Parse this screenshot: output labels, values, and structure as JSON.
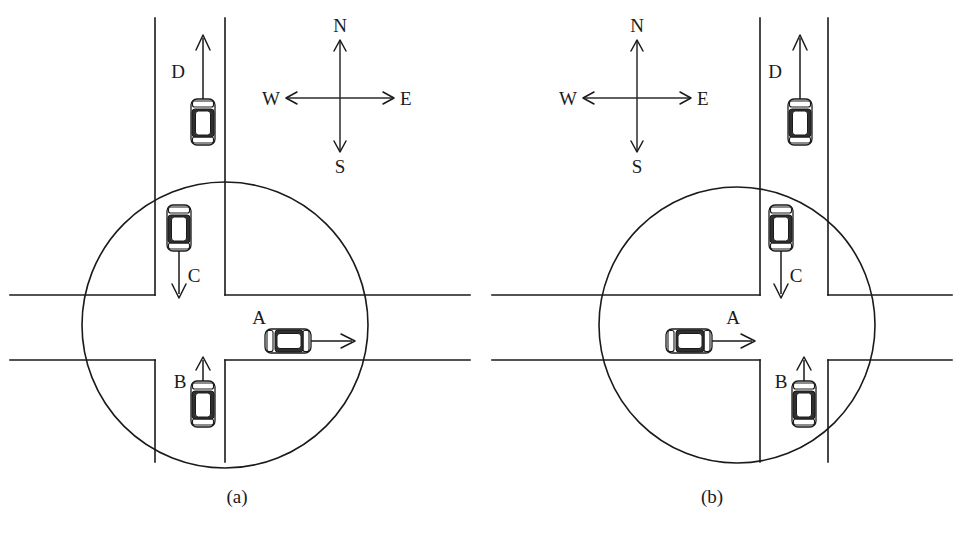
{
  "figure": {
    "background_color": "#ffffff",
    "line_color": "#1a1a1a",
    "roof_color": "#2f2f2f"
  },
  "panels": [
    {
      "id": "a",
      "caption": "(a)",
      "caption_x": 237,
      "caption_y": 503,
      "conflict_zone": {
        "cx": 225,
        "cy": 325,
        "r": 143
      },
      "roads": {
        "vertical_left_x": 155,
        "vertical_right_x": 225,
        "horizontal_top_y": 295,
        "horizontal_bottom_y": 360,
        "center_line_x": 190
      },
      "compass": {
        "cx": 340,
        "cy": 98,
        "north": "N",
        "south": "S",
        "east": "E",
        "west": "W"
      },
      "vehicles": [
        {
          "label": "A",
          "label_x": 258,
          "label_y": 323,
          "orientation": "horizontal",
          "heading": "east",
          "cx": 288,
          "cy": 341,
          "length": 46,
          "width": 23,
          "arrow_from_x": 311,
          "arrow_to_x": 352,
          "arrow_y": 341,
          "inside_zone": true,
          "description": "Car A travelling east through the intersection"
        },
        {
          "label": "B",
          "label_x": 180,
          "label_y": 383,
          "orientation": "vertical",
          "heading": "north",
          "cx": 203,
          "cy": 404,
          "length": 46,
          "width": 23,
          "arrow_from_y": 381,
          "arrow_to_y": 356,
          "arrow_x": 203,
          "inside_zone": true,
          "description": "Car B travelling north, approaching from the south"
        },
        {
          "label": "C",
          "label_x": 192,
          "label_y": 277,
          "orientation": "vertical",
          "heading": "south",
          "cx": 179,
          "cy": 228,
          "length": 46,
          "width": 23,
          "arrow_from_y": 251,
          "arrow_to_y": 297,
          "arrow_x": 179,
          "inside_zone": true,
          "description": "Car C travelling south, inside the conflict zone"
        },
        {
          "label": "D",
          "label_x": 178,
          "label_y": 76,
          "orientation": "vertical",
          "heading": "north",
          "cx": 203,
          "cy": 122,
          "length": 46,
          "width": 23,
          "arrow_from_y": 99,
          "arrow_to_y": 36,
          "arrow_x": 203,
          "inside_zone": false,
          "description": "Car D travelling north, outside the conflict zone"
        }
      ]
    },
    {
      "id": "b",
      "caption": "(b)",
      "caption_x": 712,
      "caption_y": 503,
      "conflict_zone": {
        "cx": 737,
        "cy": 325,
        "r": 138
      },
      "roads": {
        "vertical_left_x": 760,
        "vertical_right_x": 828,
        "horizontal_top_y": 295,
        "horizontal_bottom_y": 360,
        "center_line_x": 794
      },
      "compass": {
        "cx": 637,
        "cy": 98,
        "north": "N",
        "south": "S",
        "east": "E",
        "west": "W"
      },
      "vehicles": [
        {
          "label": "A",
          "label_x": 730,
          "label_y": 323,
          "orientation": "horizontal",
          "heading": "east",
          "cx": 689,
          "cy": 341,
          "length": 46,
          "width": 23,
          "arrow_from_x": 712,
          "arrow_to_x": 752,
          "arrow_y": 341,
          "inside_zone": true,
          "description": "Car A travelling east, west of the intersection centre"
        },
        {
          "label": "B",
          "label_x": 777,
          "label_y": 383,
          "orientation": "vertical",
          "heading": "north",
          "cx": 804,
          "cy": 404,
          "length": 46,
          "width": 23,
          "arrow_from_y": 381,
          "arrow_to_y": 356,
          "arrow_x": 804,
          "inside_zone": true,
          "description": "Car B travelling north, approaching from the south"
        },
        {
          "label": "C",
          "label_x": 793,
          "label_y": 277,
          "orientation": "vertical",
          "heading": "south",
          "cx": 781,
          "cy": 228,
          "length": 46,
          "width": 23,
          "arrow_from_y": 251,
          "arrow_to_y": 297,
          "arrow_x": 781,
          "inside_zone": true,
          "description": "Car C travelling south, inside the conflict zone"
        },
        {
          "label": "D",
          "label_x": 775,
          "label_y": 76,
          "orientation": "vertical",
          "heading": "north",
          "cx": 800,
          "cy": 122,
          "length": 46,
          "width": 23,
          "arrow_from_y": 99,
          "arrow_to_y": 36,
          "arrow_x": 800,
          "inside_zone": false,
          "description": "Car D travelling north, outside the conflict zone"
        }
      ]
    }
  ]
}
